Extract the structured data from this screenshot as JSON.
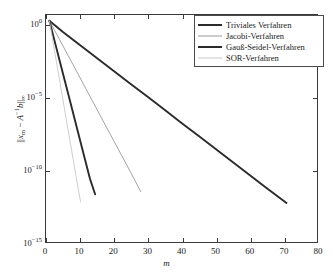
{
  "chart_data": {
    "type": "line",
    "title": "",
    "xlabel": "m",
    "ylabel": "||x_m - A^(-1)b||_inf",
    "xlim": [
      0,
      80
    ],
    "ylim": [
      1e-15,
      5
    ],
    "yscale": "log",
    "grid": false,
    "legend_position": "top-right",
    "xticks": [
      0,
      10,
      20,
      30,
      40,
      50,
      60,
      70,
      80
    ],
    "xticklabels": [
      "0",
      "10",
      "20",
      "30",
      "40",
      "50",
      "60",
      "70",
      "80"
    ],
    "yticks": [
      1,
      1e-05,
      1e-10,
      1e-15
    ],
    "yticklabels": [
      "10^0",
      "10^-5",
      "10^-10",
      "10^-15"
    ],
    "series": [
      {
        "name": "Triviales Verfahren",
        "color": "#2b2b2b",
        "width": 1.9,
        "x": [
          1,
          5,
          10,
          15,
          20,
          25,
          30,
          35,
          40,
          45,
          50,
          55,
          60,
          65,
          71
        ],
        "y": [
          2.0,
          0.33,
          0.042,
          0.0053,
          0.00067,
          8.5e-05,
          1.1e-05,
          1.4e-06,
          1.7e-07,
          2.2e-08,
          2.8e-09,
          3.5e-10,
          4.5e-11,
          5.7e-12,
          5e-13
        ]
      },
      {
        "name": "Jacobi-Verfahren",
        "color": "#9a9a9a",
        "width": 0.9,
        "x": [
          1,
          4,
          8,
          12,
          16,
          20,
          24,
          28
        ],
        "y": [
          2.0,
          0.1,
          0.0018,
          3.2e-05,
          5.6e-07,
          1e-08,
          1.8e-10,
          3e-12
        ]
      },
      {
        "name": "Gauß-Seidel-Verfahren",
        "color": "#2b2b2b",
        "width": 1.9,
        "x": [
          1,
          3,
          5,
          7,
          9,
          11,
          13,
          14.5
        ],
        "y": [
          2.0,
          0.03,
          0.00045,
          6.8e-06,
          1e-07,
          1.5e-09,
          2.3e-11,
          2e-12
        ]
      },
      {
        "name": "SOR-Verfahren",
        "color": "#c8c8c8",
        "width": 0.9,
        "x": [
          1,
          2.5,
          4,
          5.5,
          7,
          8.5,
          10.2
        ],
        "y": [
          2.0,
          0.018,
          0.00016,
          1.4e-06,
          1.3e-08,
          1.1e-10,
          6e-13
        ]
      }
    ]
  },
  "axes": {
    "xlabel": "m",
    "ylabel_norm_open": "||",
    "ylabel_x": "x",
    "ylabel_sub_m": "m",
    "ylabel_minus": " − ",
    "ylabel_A": "A",
    "ylabel_sup_inv": "−1",
    "ylabel_b": "b",
    "ylabel_norm_close": "||",
    "ylabel_sub_inf": "∞",
    "xticklabels": [
      "0",
      "10",
      "20",
      "30",
      "40",
      "50",
      "60",
      "70",
      "80"
    ],
    "yticklabels": [
      {
        "mantissa": "10",
        "exponent": "0"
      },
      {
        "mantissa": "10",
        "exponent": "−5"
      },
      {
        "mantissa": "10",
        "exponent": "−10"
      },
      {
        "mantissa": "10",
        "exponent": "−15"
      }
    ]
  },
  "legend": {
    "entries": [
      {
        "label": "Triviales Verfahren",
        "color": "#2b2b2b",
        "thickness": 2
      },
      {
        "label": "Jacobi-Verfahren",
        "color": "#9a9a9a",
        "thickness": 1
      },
      {
        "label": "Gauß-Seidel-Verfahren",
        "color": "#2b2b2b",
        "thickness": 2
      },
      {
        "label": "SOR-Verfahren",
        "color": "#c8c8c8",
        "thickness": 1
      }
    ]
  },
  "colors": {
    "axis": "#3a3a3a",
    "background": "#ffffff",
    "text": "#1a1a1a"
  }
}
